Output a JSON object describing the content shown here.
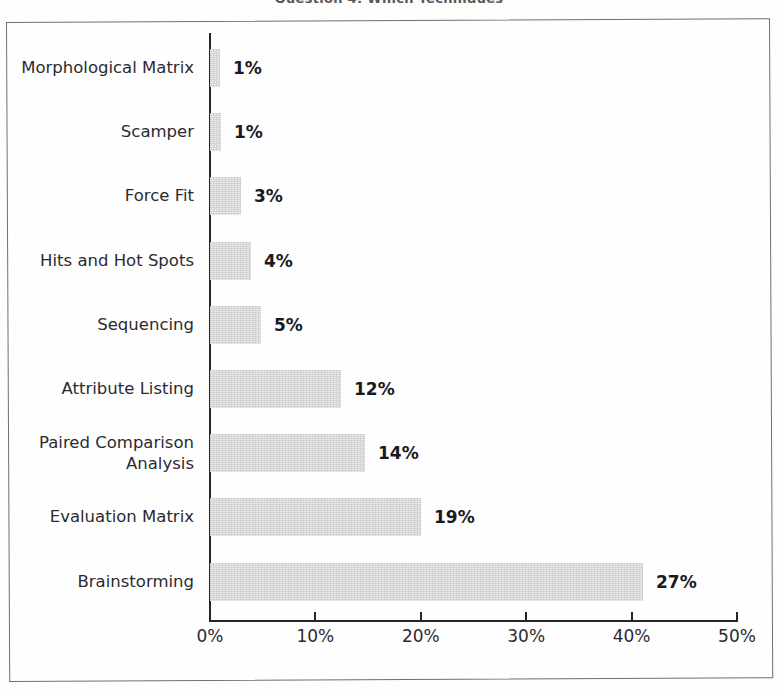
{
  "title": "Question 4: Which Techniques",
  "chart_data": {
    "type": "bar",
    "orientation": "horizontal",
    "title": "Question 4: Which Techniques",
    "xlabel": "",
    "ylabel": "",
    "xlim": [
      0,
      50
    ],
    "xticks": [
      "0%",
      "10%",
      "20%",
      "30%",
      "40%",
      "50%"
    ],
    "xtick_values": [
      0,
      10,
      20,
      30,
      40,
      50
    ],
    "grid": false,
    "legend": null,
    "bar_color": "#d2d2d2",
    "categories": [
      "Morphological Matrix",
      "Scamper",
      "Force Fit",
      "Hits and Hot Spots",
      "Sequencing",
      "Attribute Listing",
      "Paired Comparison\nAnalysis",
      "Evaluation Matrix",
      "Brainstorming"
    ],
    "values": [
      1,
      1,
      3,
      4,
      5,
      12,
      14,
      19,
      27
    ],
    "value_labels": [
      "1%",
      "1%",
      "3%",
      "4%",
      "5%",
      "12%",
      "14%",
      "19%",
      "27%"
    ],
    "bar_pixel_lengths": [
      10,
      11,
      31,
      41,
      51,
      131,
      155,
      211,
      433
    ]
  }
}
